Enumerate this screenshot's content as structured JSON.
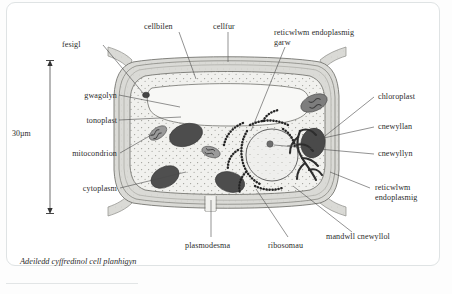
{
  "diagram": {
    "caption": "Adeiledd cyffredinol cell planhigyn",
    "scale_bar": {
      "label": "30µm"
    },
    "colors": {
      "cell_wall": "#d8d8d4",
      "cytoplasm": "#f1f1ee",
      "vacuole": "#f7f7f5",
      "chloroplast": "#4d4d4d",
      "mitochondrion": "#8f8f8f",
      "nucleus": "#efefed",
      "er": "#2d2d2d",
      "leader_line": "#4a4a4a",
      "card_border": "#dfe3e4"
    },
    "labels": [
      {
        "id": "fesigl",
        "text": "fesigl",
        "side": "top-left"
      },
      {
        "id": "cellbilen",
        "text": "cellbilen",
        "side": "top"
      },
      {
        "id": "cellfur",
        "text": "cellfur",
        "side": "top"
      },
      {
        "id": "reticwlwm-endoplasmig-garw-1",
        "text": "reticwlwm endoplasmig",
        "side": "top-right"
      },
      {
        "id": "reticwlwm-endoplasmig-garw-2",
        "text": "garw",
        "side": "top-right"
      },
      {
        "id": "gwagolyn",
        "text": "gwagolyn",
        "side": "left"
      },
      {
        "id": "tonoplast",
        "text": "tonoplast",
        "side": "left"
      },
      {
        "id": "mitocondrion",
        "text": "mitocondrion",
        "side": "left"
      },
      {
        "id": "cytoplasm",
        "text": "cytoplasm",
        "side": "left"
      },
      {
        "id": "chloroplast",
        "text": "chloroplast",
        "side": "right"
      },
      {
        "id": "cnewyllan",
        "text": "cnewyllan",
        "side": "right"
      },
      {
        "id": "cnewyllyn",
        "text": "cnewyllyn",
        "side": "right"
      },
      {
        "id": "reticwlwm-endoplasmig-1",
        "text": "reticwlwm",
        "side": "right"
      },
      {
        "id": "reticwlwm-endoplasmig-2",
        "text": "endoplasmig",
        "side": "right"
      },
      {
        "id": "mandwll-cnewyllol",
        "text": "mandwll cnewyllol",
        "side": "bottom-right"
      },
      {
        "id": "ribosomau",
        "text": "ribosomau",
        "side": "bottom"
      },
      {
        "id": "plasmodesma",
        "text": "plasmodesma",
        "side": "bottom"
      }
    ]
  }
}
